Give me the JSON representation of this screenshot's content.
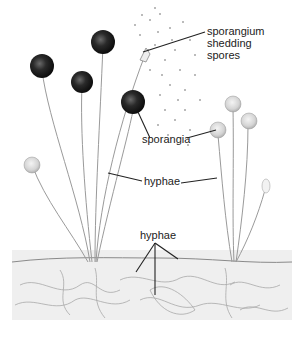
{
  "diagram": {
    "labels": {
      "sporangium_shedding": [
        "sporangium",
        "shedding",
        "spores"
      ],
      "sporangia": "sporangia",
      "hyphae_upper": "hyphae",
      "hyphae_lower": "hyphae"
    },
    "colors": {
      "dark_sporangium": "#1a1a1a",
      "light_sporangium": "#d8d8d8",
      "stalk": "#9a9a9a",
      "leader_line": "#222222",
      "substrate": "#e6e6e6"
    }
  }
}
